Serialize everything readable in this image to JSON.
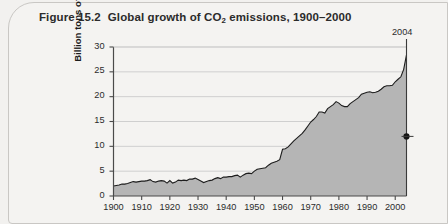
{
  "figure": {
    "label": "Figure 15.2",
    "title_before": "Global growth of CO",
    "title_sub": "2",
    "title_after": " emissions, 1900–2000"
  },
  "annotation": {
    "final_year_label": "2004",
    "marker_value": 12
  },
  "colors": {
    "area_fill": "#b5b5b5",
    "area_line": "#1d1d1d",
    "gridline": "#cfcfcf",
    "axis": "#4a4a4a",
    "background": "#f4f3f1",
    "border": "#c9c7c4",
    "text": "#2b2b2b"
  },
  "chart_data": {
    "type": "area",
    "xlabel": "",
    "ylabel": "Billion tons of CO₂",
    "xlim": [
      1900,
      2004
    ],
    "ylim": [
      0,
      30
    ],
    "grid": true,
    "legend_position": "none",
    "ytick_labels": [
      "0",
      "5",
      "10",
      "15",
      "20",
      "25",
      "30"
    ],
    "ytick_values": [
      0,
      5,
      10,
      15,
      20,
      25,
      30
    ],
    "xtick_labels": [
      "1900",
      "1910",
      "1920",
      "1930",
      "1940",
      "1950",
      "1960",
      "1970",
      "1980",
      "1990",
      "2000"
    ],
    "xtick_values": [
      1900,
      1910,
      1920,
      1930,
      1940,
      1950,
      1960,
      1970,
      1980,
      1990,
      2000
    ],
    "annotations": [
      {
        "text": "2004",
        "x": 2004,
        "type": "vertical-line-with-marker",
        "marker_y": 12
      }
    ],
    "series": [
      {
        "name": "Global CO2 emissions",
        "unit": "billion tons",
        "x": [
          1900,
          1901,
          1902,
          1903,
          1904,
          1905,
          1906,
          1907,
          1908,
          1909,
          1910,
          1911,
          1912,
          1913,
          1914,
          1915,
          1916,
          1917,
          1918,
          1919,
          1920,
          1921,
          1922,
          1923,
          1924,
          1925,
          1926,
          1927,
          1928,
          1929,
          1930,
          1931,
          1932,
          1933,
          1934,
          1935,
          1936,
          1937,
          1938,
          1939,
          1940,
          1941,
          1942,
          1943,
          1944,
          1945,
          1946,
          1947,
          1948,
          1949,
          1950,
          1951,
          1952,
          1953,
          1954,
          1955,
          1956,
          1957,
          1958,
          1959,
          1960,
          1961,
          1962,
          1963,
          1964,
          1965,
          1966,
          1967,
          1968,
          1969,
          1970,
          1971,
          1972,
          1973,
          1974,
          1975,
          1976,
          1977,
          1978,
          1979,
          1980,
          1981,
          1982,
          1983,
          1984,
          1985,
          1986,
          1987,
          1988,
          1989,
          1990,
          1991,
          1992,
          1993,
          1994,
          1995,
          1996,
          1997,
          1998,
          1999,
          2000,
          2001,
          2002,
          2003,
          2004
        ],
        "values": [
          2.0,
          2.1,
          2.2,
          2.4,
          2.4,
          2.5,
          2.7,
          2.9,
          2.8,
          2.9,
          3.0,
          3.0,
          3.1,
          3.3,
          2.9,
          2.8,
          3.0,
          3.1,
          3.0,
          2.6,
          3.1,
          2.6,
          2.8,
          3.2,
          3.1,
          3.2,
          3.1,
          3.4,
          3.4,
          3.6,
          3.3,
          3.0,
          2.7,
          2.9,
          3.1,
          3.2,
          3.5,
          3.7,
          3.5,
          3.8,
          3.8,
          3.9,
          3.9,
          4.1,
          4.2,
          3.8,
          4.2,
          4.5,
          4.6,
          4.5,
          5.0,
          5.4,
          5.5,
          5.6,
          5.7,
          6.2,
          6.6,
          6.8,
          7.0,
          7.3,
          9.4,
          9.5,
          9.9,
          10.5,
          11.1,
          11.6,
          12.1,
          12.6,
          13.3,
          14.1,
          14.9,
          15.4,
          16.0,
          16.9,
          16.9,
          16.7,
          17.6,
          18.0,
          18.4,
          19.0,
          18.7,
          18.2,
          18.0,
          18.0,
          18.6,
          19.0,
          19.4,
          19.8,
          20.5,
          20.7,
          20.9,
          21.0,
          20.8,
          20.9,
          21.1,
          21.5,
          22.0,
          22.2,
          22.2,
          22.3,
          23.0,
          23.5,
          24.0,
          25.5,
          28.4
        ]
      }
    ]
  }
}
